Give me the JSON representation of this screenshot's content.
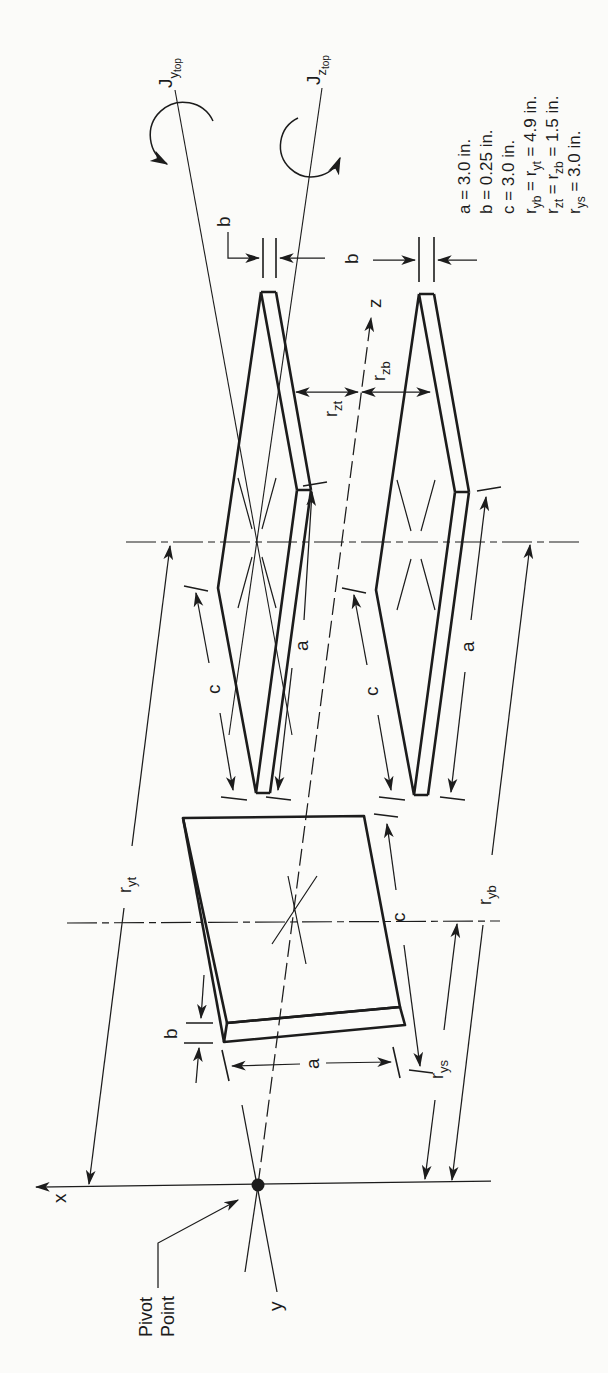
{
  "figure_type": "isometric mechanics diagram of a torsional pendulum: two thin plates and one slab on axes through a pivot point",
  "colors": {
    "ink": "#1c1c1c",
    "background": "#fbfbf9"
  },
  "axes": {
    "x": "x",
    "y": "y",
    "z": "z"
  },
  "pivot": {
    "label_line1": "Pivot",
    "label_line2": "Point"
  },
  "principal_axes": {
    "j_y": {
      "main": "J",
      "sub1": "y",
      "sub2": "top"
    },
    "j_z": {
      "main": "J",
      "sub1": "z",
      "sub2": "top"
    }
  },
  "dims": {
    "a": "a",
    "b": "b",
    "c": "c"
  },
  "radii": {
    "r_yt": {
      "main": "r",
      "sub": "yt"
    },
    "r_yb": {
      "main": "r",
      "sub": "yb"
    },
    "r_ys": {
      "main": "r",
      "sub": "ys"
    },
    "r_zt": {
      "main": "r",
      "sub": "zt"
    },
    "r_zb": {
      "main": "r",
      "sub": "zb"
    }
  },
  "given": {
    "line1": "a = 3.0 in.",
    "line2": "b = 0.25 in.",
    "line3": "c = 3.0 in.",
    "line4": {
      "p1": "r",
      "s1": "yb",
      "p2": " = r",
      "s2": "yt",
      "p3": " = 4.9 in."
    },
    "line5": {
      "p1": "r",
      "s1": "zt",
      "p2": " = r",
      "s2": "zb",
      "p3": " = 1.5 in."
    },
    "line6": {
      "p1": "r",
      "s1": "ys",
      "p2": " = 3.0 in."
    }
  }
}
